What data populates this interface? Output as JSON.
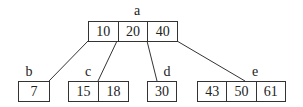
{
  "diagram": {
    "type": "B-tree",
    "nodes": {
      "a": {
        "label": "a",
        "keys": [
          "10",
          "20",
          "40"
        ]
      },
      "b": {
        "label": "b",
        "keys": [
          "7"
        ]
      },
      "c": {
        "label": "c",
        "keys": [
          "15",
          "18"
        ]
      },
      "d": {
        "label": "d",
        "keys": [
          "30"
        ]
      },
      "e": {
        "label": "e",
        "keys": [
          "43",
          "50",
          "61"
        ]
      }
    },
    "edges": [
      {
        "from": "a",
        "to": "b"
      },
      {
        "from": "a",
        "to": "c"
      },
      {
        "from": "a",
        "to": "d"
      },
      {
        "from": "a",
        "to": "e"
      }
    ]
  }
}
